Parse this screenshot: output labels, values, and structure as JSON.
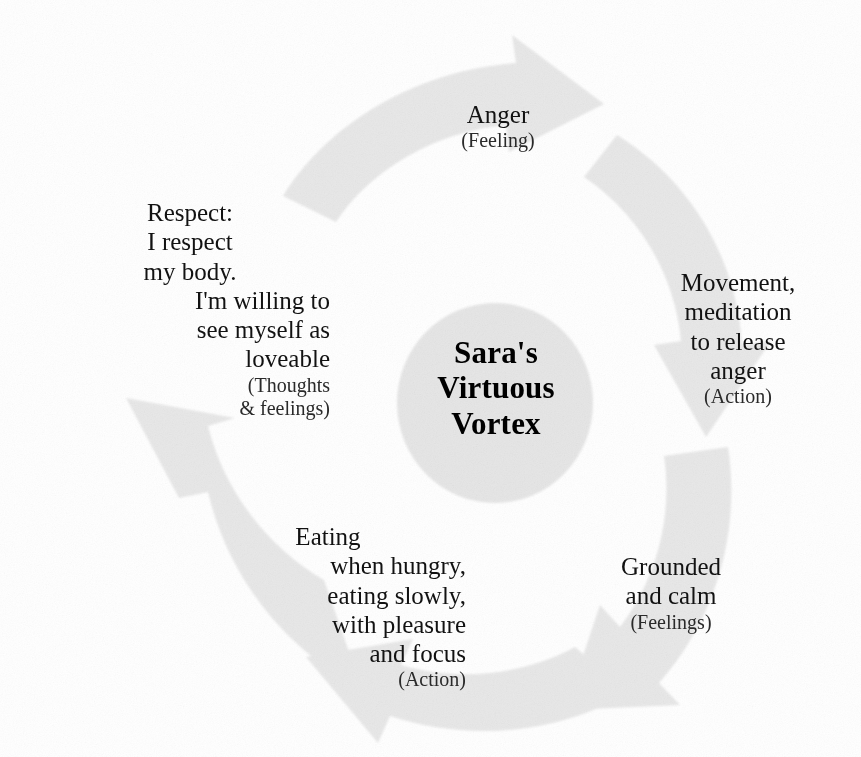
{
  "diagram": {
    "title": "Sara's Virtuous Vortex",
    "type": "cycle-diagram",
    "background_color": "#ffffff",
    "segment_fill_color": "#e8e8e8",
    "hub_fill_color": "#e6e6e6",
    "text_color": "#121212",
    "direction": "clockwise",
    "segment_count": 5
  },
  "hub": {
    "line1": "Sara's",
    "line2": "Virtuous",
    "line3": "Vortex"
  },
  "segments": [
    {
      "id": "anger",
      "position": "top",
      "lines": [
        "Anger"
      ],
      "sublabel": "(Feeling)",
      "category": "Feeling"
    },
    {
      "id": "movement",
      "position": "right",
      "lines": [
        "Movement,",
        "meditation",
        "to release",
        "anger"
      ],
      "sublabel": "(Action)",
      "category": "Action"
    },
    {
      "id": "grounded",
      "position": "bottom-right",
      "lines": [
        "Grounded",
        "and calm"
      ],
      "sublabel": "(Feelings)",
      "category": "Feelings"
    },
    {
      "id": "eating",
      "position": "bottom-left",
      "lines": [
        "Eating",
        "when hungry,",
        "eating slowly,",
        "with pleasure",
        "and focus"
      ],
      "sublabel": "(Action)",
      "category": "Action"
    },
    {
      "id": "respect",
      "position": "left",
      "lines": [
        "Respect:",
        "I respect",
        "my body.",
        "I'm willing to",
        "see myself as",
        "loveable"
      ],
      "sublabel_line1": "(Thoughts",
      "sublabel_line2": "& feelings)",
      "category": "Thoughts & feelings"
    }
  ]
}
